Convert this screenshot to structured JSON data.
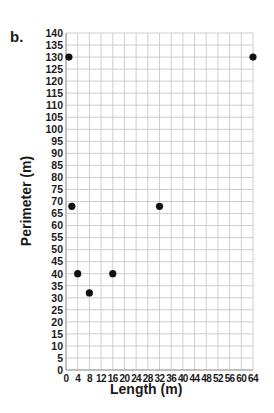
{
  "part_label": "b.",
  "chart_data": {
    "type": "scatter",
    "title": "",
    "xlabel": "Length (m)",
    "ylabel": "Perimeter (m)",
    "xlim": [
      0,
      64
    ],
    "ylim": [
      0,
      140
    ],
    "xticks": [
      0,
      4,
      8,
      12,
      16,
      20,
      24,
      28,
      32,
      36,
      40,
      44,
      48,
      52,
      56,
      60,
      64
    ],
    "yticks": [
      0,
      5,
      10,
      15,
      20,
      25,
      30,
      35,
      40,
      45,
      50,
      55,
      60,
      65,
      70,
      75,
      80,
      85,
      90,
      95,
      100,
      105,
      110,
      115,
      120,
      125,
      130,
      135,
      140
    ],
    "grid": true,
    "legend": null,
    "series": [
      {
        "name": "Perimeter",
        "points": [
          {
            "x": 1,
            "y": 130
          },
          {
            "x": 2,
            "y": 68
          },
          {
            "x": 4,
            "y": 40
          },
          {
            "x": 8,
            "y": 32
          },
          {
            "x": 16,
            "y": 40
          },
          {
            "x": 32,
            "y": 68
          },
          {
            "x": 64,
            "y": 130
          }
        ],
        "color": "#111111"
      }
    ]
  },
  "colors": {
    "grid": "#c8c8c8",
    "axis": "#999999",
    "point": "#111111"
  }
}
